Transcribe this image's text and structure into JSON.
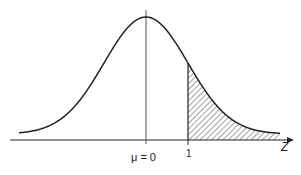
{
  "diagram": {
    "title": "",
    "axis_label": "Z",
    "mean_label": "μ = 0",
    "tick_label": "1",
    "shaded_region": "z ≥ 1",
    "colors": {
      "line": "#222222",
      "hatch": "#444444",
      "background": "#ffffff"
    }
  }
}
